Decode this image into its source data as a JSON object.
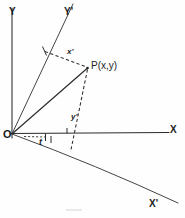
{
  "figure": {
    "background_color": "#fefefe",
    "ink_color": "#2b2b2b"
  },
  "labels": {
    "y_axis": "Y",
    "y_prime_axis": "Y'",
    "x_axis": "X",
    "x_prime_axis": "X'",
    "origin": "O",
    "point": "P(x,y)",
    "x_prime_coord": "x'",
    "y_prime_coord": "y'",
    "angle": "t"
  },
  "geometry": {
    "origin": {
      "x": 12,
      "y": 134
    },
    "point_p": {
      "x": 88,
      "y": 68
    },
    "x_axis_end": {
      "x": 168,
      "y": 133
    },
    "y_axis_top": {
      "x": 12,
      "y": 8
    },
    "y_prime_end": {
      "x": 73,
      "y": 4
    },
    "x_prime_end": {
      "x": 178,
      "y": 203
    },
    "x_prime_foot": {
      "x": 45,
      "y": 52
    },
    "y_prime_foot": {
      "x": 71,
      "y": 152
    },
    "rotation_angle_deg": 21
  },
  "elements": [
    {
      "name": "y-axis",
      "type": "solid-axis"
    },
    {
      "name": "x-axis",
      "type": "solid-axis"
    },
    {
      "name": "y-prime-axis",
      "type": "solid-axis"
    },
    {
      "name": "x-prime-axis",
      "type": "solid-axis"
    },
    {
      "name": "op-radius",
      "type": "solid-segment"
    },
    {
      "name": "x-prime-projection",
      "type": "dashed-segment"
    },
    {
      "name": "y-prime-projection",
      "type": "dashed-segment"
    },
    {
      "name": "angle-arc",
      "type": "dashed-arc"
    }
  ]
}
